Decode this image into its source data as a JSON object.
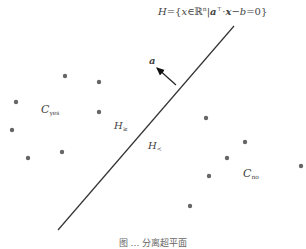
{
  "hyperplane": {
    "equation": "H={x∈ℝⁿ | aᵀ·x−b=0}",
    "line": {
      "x1": 58,
      "y1": 230,
      "x2": 234,
      "y2": 26
    },
    "color": "#333333"
  },
  "normal_vector": {
    "label": "a",
    "from": {
      "x": 176,
      "y": 85
    },
    "to": {
      "x": 156,
      "y": 67
    }
  },
  "labels": {
    "c_yes": {
      "main": "C",
      "sub": "yes"
    },
    "c_no": {
      "main": "C",
      "sub": "no"
    },
    "h_geq": {
      "main": "H",
      "sub": "≥"
    },
    "h_lt": {
      "main": "H",
      "sub": "<"
    }
  },
  "points": {
    "color": "#666666",
    "yes": [
      [
        65,
        76
      ],
      [
        99,
        82
      ],
      [
        16,
        102
      ],
      [
        99,
        112
      ],
      [
        12,
        130
      ],
      [
        62,
        152
      ],
      [
        28,
        158
      ]
    ],
    "no": [
      [
        206,
        118
      ],
      [
        245,
        142
      ],
      [
        227,
        158
      ],
      [
        209,
        176
      ],
      [
        301,
        166
      ],
      [
        190,
        206
      ]
    ]
  },
  "caption": "图 … 分离超平面"
}
